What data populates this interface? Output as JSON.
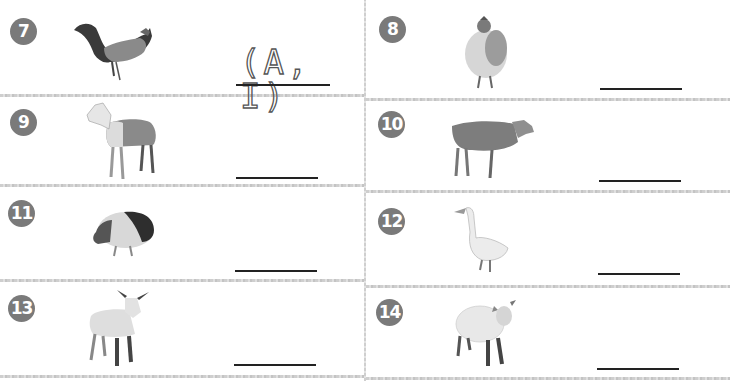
{
  "worksheet": {
    "items": [
      {
        "number": "7",
        "animal": "rooster",
        "answer": "(A, I)",
        "answer_style": "dotted-trace"
      },
      {
        "number": "8",
        "animal": "hen",
        "answer": ""
      },
      {
        "number": "9",
        "animal": "horse",
        "answer": ""
      },
      {
        "number": "10",
        "animal": "cow",
        "answer": ""
      },
      {
        "number": "11",
        "animal": "pig",
        "answer": ""
      },
      {
        "number": "12",
        "animal": "goose",
        "answer": ""
      },
      {
        "number": "13",
        "animal": "goat",
        "answer": ""
      },
      {
        "number": "14",
        "animal": "sheep",
        "answer": ""
      }
    ]
  },
  "colors": {
    "number_badge": "#7a7a7a",
    "answer_line": "#222222",
    "divider": "#c9c9c9"
  }
}
